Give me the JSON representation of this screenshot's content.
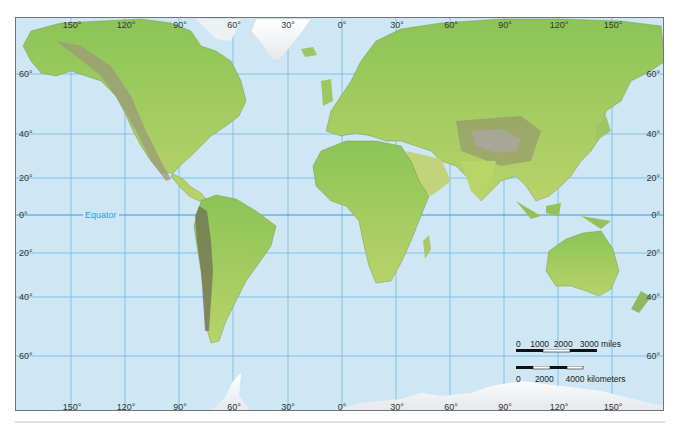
{
  "map": {
    "projection": "Mercator",
    "colors": {
      "ocean": "#cfe7f4",
      "gridline": "#5fb3e0",
      "equator": "#2a9fd6",
      "land_low": "#7cbf4e",
      "land_mid": "#b9d56a",
      "land_high": "#9a9a78",
      "ice": "#f4f6f8"
    },
    "equator_label": "Equator",
    "longitude_labels_top": [
      "150°",
      "120°",
      "90°",
      "60°",
      "30°",
      "0°",
      "30°",
      "60°",
      "90°",
      "120°",
      "150°"
    ],
    "longitude_labels_bottom": [
      "150°",
      "120°",
      "90°",
      "60°",
      "30°",
      "0°",
      "30°",
      "60°",
      "90°",
      "120°",
      "150°"
    ],
    "latitude_labels_left": [
      "60°",
      "40°",
      "20°",
      "0°",
      "20°",
      "40°",
      "60°"
    ],
    "latitude_labels_right": [
      "60°",
      "40°",
      "20°",
      "0°",
      "20°",
      "40°",
      "60°"
    ],
    "scale_bar": {
      "miles": {
        "ticks": [
          "0",
          "1000",
          "2000",
          "3000"
        ],
        "unit": "miles",
        "text": "0    1000  2000   3000 miles"
      },
      "kilometers": {
        "ticks": [
          "0",
          "2000",
          "4000"
        ],
        "unit": "kilometers",
        "text": "0      2000     4000 kilometers"
      }
    }
  }
}
